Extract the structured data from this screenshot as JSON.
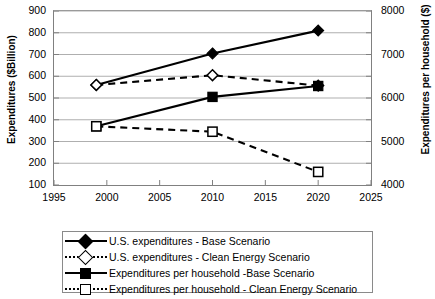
{
  "chart_data": {
    "type": "line",
    "title": "",
    "xlabel": "",
    "ylabel": "Expenditures ($Billion)",
    "y2label": "Expenditures per household ($)",
    "x": [
      1999,
      2010,
      2020
    ],
    "xlim": [
      1995,
      2025
    ],
    "xticks": [
      1995,
      2000,
      2005,
      2010,
      2015,
      2020,
      2025
    ],
    "ylim": [
      100,
      900
    ],
    "yticks": [
      100,
      200,
      300,
      400,
      500,
      600,
      700,
      800,
      900
    ],
    "y2lim": [
      4000,
      8000
    ],
    "y2ticks": [
      4000,
      5000,
      6000,
      7000,
      8000
    ],
    "y2_minor_step": 500,
    "grid": "horizontal",
    "legend_position": "bottom",
    "series": [
      {
        "name": "U.S. expenditures - Base Scenario",
        "axis": "left",
        "marker": "filled-diamond",
        "linestyle": "solid",
        "values": [
          560,
          705,
          810
        ]
      },
      {
        "name": "U.S. expenditures - Clean Energy Scenario",
        "axis": "left",
        "marker": "open-diamond",
        "linestyle": "dashed",
        "values": [
          560,
          605,
          557
        ]
      },
      {
        "name": "Expenditures per household -Base Scenario",
        "axis": "right",
        "marker": "filled-square",
        "linestyle": "solid",
        "values_left_scale": [
          370,
          505,
          555
        ],
        "values": [
          5350,
          6025,
          6275
        ]
      },
      {
        "name": "Expenditures per household - Clean Energy Scenario",
        "axis": "right",
        "marker": "open-square",
        "linestyle": "dashed",
        "values_left_scale": [
          370,
          345,
          160
        ],
        "values": [
          5350,
          5225,
          4300
        ]
      }
    ]
  },
  "axes": {
    "left_title": "Expenditures ($Billion)",
    "right_title": "Expenditures per household ($)",
    "y_left_labels": [
      "900",
      "800",
      "700",
      "600",
      "500",
      "400",
      "300",
      "200",
      "100"
    ],
    "y_right_labels": [
      "8000",
      "7000",
      "6000",
      "5000",
      "4000"
    ],
    "x_labels": [
      "1995",
      "2000",
      "2005",
      "2010",
      "2015",
      "2020",
      "2025"
    ]
  },
  "legend": {
    "items": [
      {
        "label": "U.S. expenditures - Base Scenario"
      },
      {
        "label": "U.S. expenditures - Clean Energy Scenario"
      },
      {
        "label": "Expenditures per household -Base Scenario"
      },
      {
        "label": "Expenditures per household - Clean Energy Scenario"
      }
    ]
  },
  "colors": {
    "line": "#000000",
    "grid": "#a6a6a6",
    "axis": "#808080",
    "background": "#ffffff"
  }
}
